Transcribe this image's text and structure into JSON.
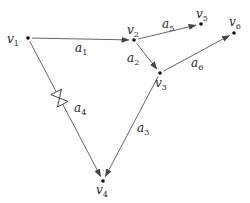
{
  "diagram": {
    "type": "directed-graph",
    "nodes": [
      {
        "id": "v1",
        "name": "v",
        "sub": "1",
        "x": 28,
        "y": 38,
        "lx": 7,
        "ly": 43
      },
      {
        "id": "v2",
        "name": "v",
        "sub": "2",
        "x": 134,
        "y": 40,
        "lx": 127,
        "ly": 34
      },
      {
        "id": "v3",
        "name": "v",
        "sub": "3",
        "x": 160,
        "y": 73,
        "lx": 155,
        "ly": 87
      },
      {
        "id": "v4",
        "name": "v",
        "sub": "4",
        "x": 103,
        "y": 181,
        "lx": 96,
        "ly": 194
      },
      {
        "id": "v5",
        "name": "v",
        "sub": "5",
        "x": 201,
        "y": 24,
        "lx": 196,
        "ly": 18
      },
      {
        "id": "v6",
        "name": "v",
        "sub": "6",
        "x": 234,
        "y": 33,
        "lx": 229,
        "ly": 26
      }
    ],
    "edges": [
      {
        "id": "a1",
        "from": "v1",
        "to": "v2",
        "name": "a",
        "sub": "1",
        "lx": 75,
        "ly": 52
      },
      {
        "id": "a2",
        "from": "v2",
        "to": "v3",
        "name": "a",
        "sub": "2",
        "lx": 127,
        "ly": 62
      },
      {
        "id": "a3",
        "from": "v3",
        "to": "v4",
        "name": "a",
        "sub": "3",
        "lx": 137,
        "ly": 132
      },
      {
        "id": "a4",
        "from": "v1",
        "to": "v4",
        "name": "a",
        "sub": "4",
        "lx": 74,
        "ly": 112,
        "marker": "bowtie"
      },
      {
        "id": "a5",
        "from": "v2",
        "to": "v5",
        "name": "a",
        "sub": "5",
        "lx": 162,
        "ly": 28
      },
      {
        "id": "a6",
        "from": "v3",
        "to": "v6",
        "name": "a",
        "sub": "6",
        "lx": 191,
        "ly": 67
      }
    ],
    "colors": {
      "line": "#555555",
      "text": "#2a2a2a",
      "background": "#ffffff"
    }
  }
}
